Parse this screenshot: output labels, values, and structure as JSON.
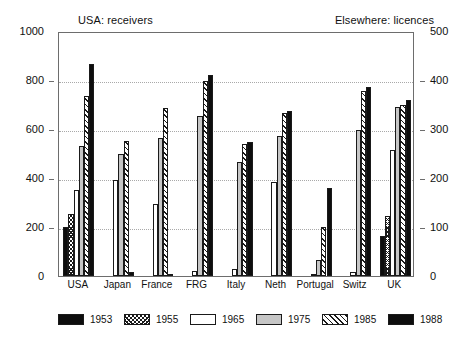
{
  "chart_data": {
    "type": "bar",
    "title": "",
    "subtitle": "",
    "caption_left": "USA: receivers",
    "caption_right": "Elsewhere: licences",
    "xlabel": "",
    "ylabel": "",
    "grid": true,
    "legend_position": "bottom",
    "categories": [
      "USA",
      "Japan",
      "France",
      "FRG",
      "Italy",
      "Neth",
      "Portugal",
      "Switz",
      "UK"
    ],
    "left_axis": {
      "label": "",
      "ylim": [
        0,
        1000
      ],
      "ticks": [
        0,
        200,
        400,
        600,
        800,
        1000
      ],
      "tick_labels": [
        "0",
        "200",
        "400",
        "600",
        "800",
        "1000"
      ]
    },
    "right_axis": {
      "label": "",
      "ylim": [
        0,
        500
      ],
      "ticks": [
        0,
        100,
        200,
        300,
        400,
        500
      ],
      "tick_labels": [
        "0",
        "100",
        "200",
        "300",
        "400",
        "500"
      ]
    },
    "series": [
      {
        "name": "1953",
        "fill": "solid",
        "color": "#0d0d0d",
        "values": [
          200,
          0,
          0,
          0,
          0,
          0,
          0,
          0,
          165
        ]
      },
      {
        "name": "1955",
        "fill": "cross-hatch",
        "color": "#ffffff",
        "values": [
          255,
          0,
          0,
          0,
          0,
          0,
          0,
          0,
          245
        ]
      },
      {
        "name": "1965",
        "fill": "white",
        "color": "#ffffff",
        "values": [
          350,
          390,
          295,
          20,
          30,
          385,
          10,
          15,
          515
        ]
      },
      {
        "name": "1975",
        "fill": "light-gray",
        "color": "#c6c6c6",
        "values": [
          530,
          500,
          565,
          655,
          465,
          570,
          65,
          595,
          690
        ]
      },
      {
        "name": "1985",
        "fill": "diagonal-hatch",
        "color": "#ffffff",
        "values": [
          735,
          550,
          685,
          795,
          540,
          665,
          200,
          755,
          700
        ]
      },
      {
        "name": "1988",
        "fill": "solid",
        "color": "#0d0d0d",
        "values": [
          865,
          15,
          10,
          820,
          545,
          675,
          360,
          770,
          720
        ]
      }
    ]
  },
  "legend": {
    "items": [
      {
        "label": "1953",
        "fill": "solid"
      },
      {
        "label": "1955",
        "fill": "cross-hatch"
      },
      {
        "label": "1965",
        "fill": "white"
      },
      {
        "label": "1975",
        "fill": "light-gray"
      },
      {
        "label": "1985",
        "fill": "diagonal-hatch"
      },
      {
        "label": "1988",
        "fill": "solid"
      }
    ]
  }
}
